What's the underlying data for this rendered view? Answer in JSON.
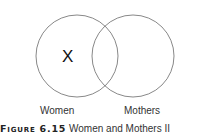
{
  "diagram": {
    "type": "venn",
    "sets": [
      {
        "label": "Women",
        "marker": "X"
      },
      {
        "label": "Mothers",
        "marker": ""
      }
    ]
  },
  "caption": {
    "figure_tag": "Figure 6.15",
    "title": "Women and Mothers II"
  },
  "colors": {
    "circle_stroke": "#7a7a7a",
    "text": "#222222"
  }
}
